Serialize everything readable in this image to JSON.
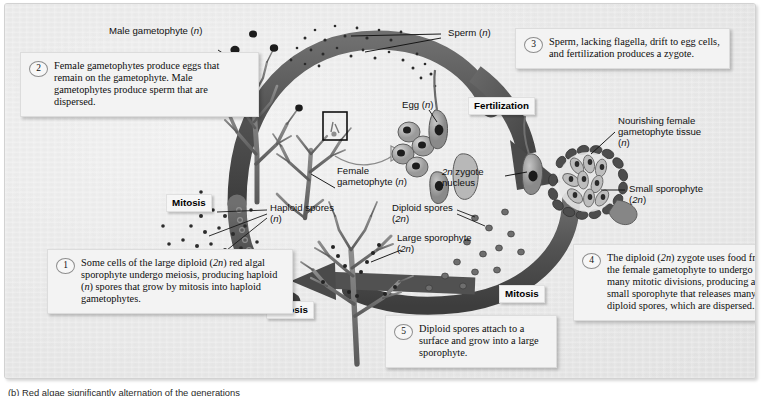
{
  "figure": {
    "kind": "red-algal-life-cycle-diagram",
    "caption": "(b) Red algae significantly alternation of the generations"
  },
  "palette": {
    "panel_bg": "#ececec",
    "arrow_dark": "#4c4c4c",
    "arrow_mid": "#6e6e6e",
    "ink": "#111111",
    "plate": "#f6f6f6"
  },
  "callouts": [
    {
      "id": "step-2",
      "number": "2",
      "text": "Female gametophytes produce eggs that remain on the gametophyte. Male gametophytes produce sperm that are dispersed."
    },
    {
      "id": "step-3",
      "number": "3",
      "text": "Sperm, lacking flagella, drift to egg cells, and fertilization produces a zygote."
    },
    {
      "id": "step-1",
      "number": "1",
      "text": "Some cells of the large diploid (2n) red algal sporophyte undergo meiosis, producing haploid (n) spores that grow by mitosis into haploid gametophytes."
    },
    {
      "id": "step-4",
      "number": "4",
      "text": "The diploid (2n) zygote uses food from the female gametophyte to undergo many mitotic divisions, producing a small sporophyte that releases many diploid spores, which are dispersed."
    },
    {
      "id": "step-5",
      "number": "5",
      "text": "Diploid spores attach to a surface and grow into a large sporophyte."
    }
  ],
  "labels": {
    "male_gametophyte": "Male gametophyte (n)",
    "sperm": "Sperm (n)",
    "egg": "Egg (n)",
    "female_gametophyte": "Female\ngametophyte (n)",
    "zygote_nucleus": "2n zygote\nnucleus",
    "nourishing_tissue": "Nourishing female\ngametophyte tissue\n(n)",
    "small_sporophyte": "Small sporophyte\n(2n)",
    "haploid_spores": "Haploid spores\n(n)",
    "diploid_spores": "Diploid spores\n(2n)",
    "large_sporophyte": "Large sporophyte\n(2n)"
  },
  "stage_labels": {
    "fertilization": "Fertilization",
    "mitosis_left": "Mitosis",
    "mitosis_right": "Mitosis",
    "meiosis": "Meiosis"
  }
}
